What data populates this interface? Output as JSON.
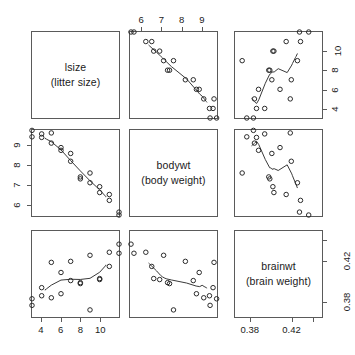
{
  "figure": {
    "type": "scatterplot-matrix",
    "title": "",
    "background_color": "#ffffff",
    "frame_color": "#5a5a5a",
    "point_color": "#2b2b2b",
    "smoother_color": "#3a3a3a",
    "point_symbol": "open-circle",
    "n_variables": 3,
    "n_observations": 20
  },
  "variables": [
    {
      "key": "lsize",
      "name": "lsize",
      "description": "(litter size)",
      "axis_ticks": [
        "4",
        "6",
        "8",
        "10"
      ],
      "tick_values": [
        4,
        6,
        8,
        10
      ],
      "range": [
        3,
        12
      ]
    },
    {
      "key": "bodywt",
      "name": "bodywt",
      "description": "(body weight)",
      "axis_ticks": [
        "6",
        "7",
        "8",
        "9"
      ],
      "tick_values": [
        6,
        7,
        8,
        9
      ],
      "range": [
        5.4,
        9.8
      ]
    },
    {
      "key": "brainwt",
      "name": "brainwt",
      "description": "(brain weight)",
      "axis_ticks": [
        "0.38",
        "0.42"
      ],
      "tick_values": [
        0.38,
        0.42
      ],
      "range": [
        0.365,
        0.45
      ]
    }
  ],
  "chart_data": {
    "type": "scatter",
    "title": "",
    "xlabel": "",
    "ylabel": "",
    "grid": false,
    "legend": "none",
    "layout": "3x3 scatterplot matrix, variable names on diagonal, LOWESS smoother in each off-diagonal panel",
    "axis_placement": {
      "column_1_bottom": [
        "4",
        "6",
        "8",
        "10"
      ],
      "column_2_top": [
        "6",
        "7",
        "8",
        "9"
      ],
      "column_3_bottom": [
        "0.38",
        "0.42"
      ],
      "row_1_right": [
        "4",
        "6",
        "8",
        "10"
      ],
      "row_2_left": [
        "6",
        "7",
        "8",
        "9"
      ],
      "row_3_right": [
        "0.38",
        "0.42"
      ]
    },
    "variables": [
      "lsize",
      "bodywt",
      "brainwt"
    ],
    "observations": [
      {
        "lsize": 3,
        "bodywt": 9.45,
        "brainwt": 0.3765
      },
      {
        "lsize": 3,
        "bodywt": 9.78,
        "brainwt": 0.383
      },
      {
        "lsize": 4,
        "bodywt": 9.42,
        "brainwt": 0.386
      },
      {
        "lsize": 4,
        "bodywt": 9.6,
        "brainwt": 0.394
      },
      {
        "lsize": 5,
        "bodywt": 9.65,
        "brainwt": 0.419
      },
      {
        "lsize": 5,
        "bodywt": 9.13,
        "brainwt": 0.384
      },
      {
        "lsize": 6,
        "bodywt": 8.9,
        "brainwt": 0.409
      },
      {
        "lsize": 6,
        "bodywt": 8.76,
        "brainwt": 0.388
      },
      {
        "lsize": 7,
        "bodywt": 8.6,
        "brainwt": 0.401
      },
      {
        "lsize": 7,
        "bodywt": 8.2,
        "brainwt": 0.42
      },
      {
        "lsize": 8,
        "bodywt": 7.4,
        "brainwt": 0.398
      },
      {
        "lsize": 8,
        "bodywt": 7.3,
        "brainwt": 0.399
      },
      {
        "lsize": 9,
        "bodywt": 7.6,
        "brainwt": 0.372
      },
      {
        "lsize": 9,
        "bodywt": 7.1,
        "brainwt": 0.426
      },
      {
        "lsize": 10,
        "bodywt": 6.9,
        "brainwt": 0.402
      },
      {
        "lsize": 10,
        "bodywt": 6.6,
        "brainwt": 0.403
      },
      {
        "lsize": 11,
        "bodywt": 6.5,
        "brainwt": 0.415
      },
      {
        "lsize": 11,
        "bodywt": 6.2,
        "brainwt": 0.429
      },
      {
        "lsize": 12,
        "bodywt": 5.6,
        "brainwt": 0.428
      },
      {
        "lsize": 12,
        "bodywt": 5.45,
        "brainwt": 0.437
      }
    ],
    "panels": [
      {
        "row": 1,
        "col": 1,
        "kind": "diagonal",
        "variable": "lsize"
      },
      {
        "row": 1,
        "col": 2,
        "kind": "scatter",
        "x": "bodywt",
        "y": "lsize",
        "trend": "negative"
      },
      {
        "row": 1,
        "col": 3,
        "kind": "scatter",
        "x": "brainwt",
        "y": "lsize",
        "trend": "negative"
      },
      {
        "row": 2,
        "col": 1,
        "kind": "scatter",
        "x": "lsize",
        "y": "bodywt",
        "trend": "negative"
      },
      {
        "row": 2,
        "col": 2,
        "kind": "diagonal",
        "variable": "bodywt"
      },
      {
        "row": 2,
        "col": 3,
        "kind": "scatter",
        "x": "brainwt",
        "y": "bodywt",
        "trend": "positive"
      },
      {
        "row": 3,
        "col": 1,
        "kind": "scatter",
        "x": "lsize",
        "y": "brainwt",
        "trend": "negative"
      },
      {
        "row": 3,
        "col": 2,
        "kind": "scatter",
        "x": "bodywt",
        "y": "brainwt",
        "trend": "positive"
      },
      {
        "row": 3,
        "col": 3,
        "kind": "diagonal",
        "variable": "brainwt"
      }
    ]
  }
}
